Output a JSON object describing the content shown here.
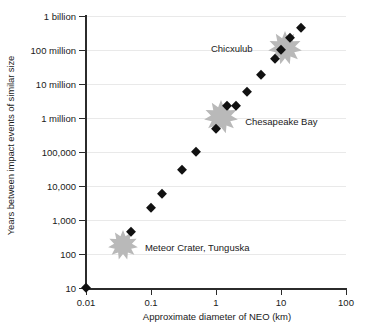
{
  "chart_data": {
    "type": "scatter",
    "title": "",
    "xlabel": "Approximate diameter of NEO (km)",
    "ylabel": "Years between impact events of similar size",
    "xscale": "log",
    "yscale": "log",
    "xlim": [
      0.01,
      100
    ],
    "ylim": [
      10,
      1000000000
    ],
    "grid": true,
    "legend": false,
    "xticks": [
      {
        "value": 0.01,
        "label": "0.01"
      },
      {
        "value": 0.1,
        "label": "0.1"
      },
      {
        "value": 1,
        "label": "1"
      },
      {
        "value": 10,
        "label": "10"
      },
      {
        "value": 100,
        "label": "100"
      }
    ],
    "yticks": [
      {
        "value": 10,
        "label": "10"
      },
      {
        "value": 100,
        "label": "100"
      },
      {
        "value": 1000,
        "label": "1,000"
      },
      {
        "value": 10000,
        "label": "10,000"
      },
      {
        "value": 100000,
        "label": "100,000"
      },
      {
        "value": 1000000,
        "label": "1 million"
      },
      {
        "value": 10000000,
        "label": "10 million"
      },
      {
        "value": 100000000,
        "label": "100 million"
      },
      {
        "value": 1000000000,
        "label": "1 billion"
      }
    ],
    "series": [
      {
        "name": "Impact interval",
        "marker": "diamond",
        "color": "#111111",
        "points": [
          {
            "x": 0.01,
            "y": 10
          },
          {
            "x": 0.05,
            "y": 450
          },
          {
            "x": 0.1,
            "y": 2300
          },
          {
            "x": 0.15,
            "y": 6000
          },
          {
            "x": 0.3,
            "y": 29000
          },
          {
            "x": 0.5,
            "y": 97000
          },
          {
            "x": 1.0,
            "y": 470000
          },
          {
            "x": 1.5,
            "y": 2200000
          },
          {
            "x": 2.0,
            "y": 2300000
          },
          {
            "x": 3.0,
            "y": 5700000
          },
          {
            "x": 5.0,
            "y": 19000000
          },
          {
            "x": 8.0,
            "y": 55000000
          },
          {
            "x": 10.0,
            "y": 100000000
          },
          {
            "x": 14.0,
            "y": 220000000
          },
          {
            "x": 20.0,
            "y": 440000000
          }
        ]
      }
    ],
    "annotations": [
      {
        "label": "Meteor Crater, Tunguska",
        "marker": "starburst",
        "color": "#b9b9b9",
        "x": 0.037,
        "y": 190,
        "size": 30,
        "text_offset_x": 22,
        "text_offset_y": 2
      },
      {
        "label": "Chesapeake Bay",
        "marker": "starburst",
        "color": "#b9b9b9",
        "x": 1.2,
        "y": 1100000,
        "size": 34,
        "text_offset_x": 24,
        "text_offset_y": 4
      },
      {
        "label": "Chicxulub",
        "marker": "starburst",
        "color": "#b9b9b9",
        "x": 11.5,
        "y": 115000000,
        "size": 34,
        "text_offset_x": -74,
        "text_offset_y": 0
      }
    ]
  }
}
